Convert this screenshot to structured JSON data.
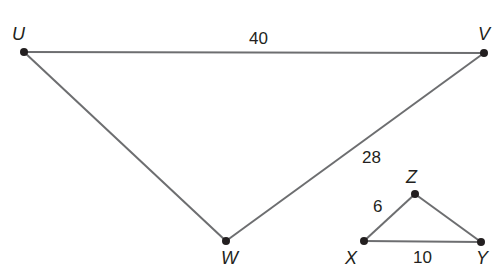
{
  "diagram": {
    "type": "similar-triangles",
    "colors": {
      "edge": "#6d6e70",
      "point": "#231f20",
      "text": "#231f20"
    },
    "triangles": [
      {
        "name": "UVW",
        "vertices": {
          "U": "U",
          "V": "V",
          "W": "W"
        },
        "sides": {
          "UV": "40",
          "VW": "28"
        }
      },
      {
        "name": "XYZ",
        "vertices": {
          "X": "X",
          "Y": "Y",
          "Z": "Z"
        },
        "sides": {
          "XZ": "6",
          "XY": "10"
        }
      }
    ]
  }
}
